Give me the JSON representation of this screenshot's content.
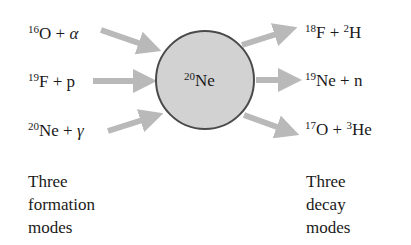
{
  "nucleus": {
    "mass": "20",
    "symbol": "Ne"
  },
  "formation": [
    {
      "mass": "16",
      "symbol": "O",
      "plus": " + ",
      "partner": "α",
      "partner_mass": ""
    },
    {
      "mass": "19",
      "symbol": "F",
      "plus": " + ",
      "partner": "p",
      "partner_mass": ""
    },
    {
      "mass": "20",
      "symbol": "Ne",
      "plus": " + ",
      "partner": "γ",
      "partner_mass": ""
    }
  ],
  "decay": [
    {
      "mass": "18",
      "symbol": "F",
      "plus": " + ",
      "partner_mass": "2",
      "partner": "H"
    },
    {
      "mass": "19",
      "symbol": "Ne",
      "plus": " + ",
      "partner_mass": "",
      "partner": "n"
    },
    {
      "mass": "17",
      "symbol": "O",
      "plus": " + ",
      "partner_mass": "3",
      "partner": "He"
    }
  ],
  "captions": {
    "left": {
      "line1": "Three",
      "line2": "formation",
      "line3": "modes"
    },
    "right": {
      "line1": "Three",
      "line2": "decay",
      "line3": "modes"
    }
  },
  "colors": {
    "circle_fill": "#d2d2d2",
    "circle_stroke": "#4a4a4a",
    "arrow": "#b9b9b9"
  }
}
